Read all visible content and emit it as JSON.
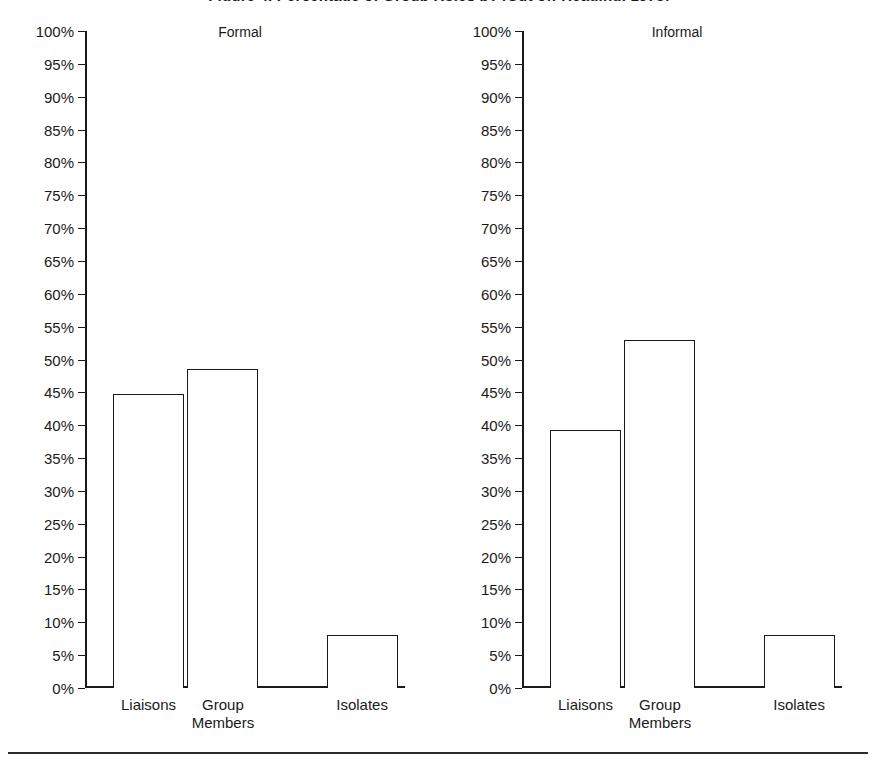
{
  "figure": {
    "title": "Figure 4. Percentage of Group Roles by (Cut off Heading, 1978)",
    "bottom_rule": true
  },
  "axis": {
    "tick_labels": [
      "100%",
      "95%",
      "90%",
      "85%",
      "80%",
      "75%",
      "70%",
      "65%",
      "60%",
      "55%",
      "50%",
      "45%",
      "40%",
      "35%",
      "30%",
      "25%",
      "20%",
      "15%",
      "10%",
      "5%",
      "0%"
    ],
    "tick_values": [
      100,
      95,
      90,
      85,
      80,
      75,
      70,
      65,
      60,
      55,
      50,
      45,
      40,
      35,
      30,
      25,
      20,
      15,
      10,
      5,
      0
    ],
    "min": 0,
    "max": 100,
    "step": 5
  },
  "panels": [
    {
      "key": "formal",
      "title": "Formal",
      "categories": [
        "Liaisons",
        "Group\nMembers",
        "Isolates"
      ],
      "values": [
        44.8,
        48.5,
        8.0
      ]
    },
    {
      "key": "informal",
      "title": "Informal",
      "categories": [
        "Liaisons",
        "Group\nMembers",
        "Isolates"
      ],
      "values": [
        39.3,
        53.0,
        8.0
      ]
    }
  ],
  "chart_data": {
    "type": "bar",
    "title": "Figure 4. Percentage of Group Roles by (Cut off Heading, 1978)",
    "xlabel": "",
    "ylabel": "",
    "ylim": [
      0,
      100
    ],
    "ytick_step": 5,
    "grid": false,
    "legend": "none",
    "bar_style": "hollow outline, black stroke, white fill",
    "categories": [
      "Liaisons",
      "Group Members",
      "Isolates"
    ],
    "panels": [
      {
        "name": "Formal",
        "categories": [
          "Liaisons",
          "Group Members",
          "Isolates"
        ],
        "values": [
          44.8,
          48.5,
          8.0
        ],
        "units": "percent"
      },
      {
        "name": "Informal",
        "categories": [
          "Liaisons",
          "Group Members",
          "Isolates"
        ],
        "values": [
          39.3,
          53.0,
          8.0
        ],
        "units": "percent"
      }
    ],
    "ytick_labels": [
      "0%",
      "5%",
      "10%",
      "15%",
      "20%",
      "25%",
      "30%",
      "35%",
      "40%",
      "45%",
      "50%",
      "55%",
      "60%",
      "65%",
      "70%",
      "75%",
      "80%",
      "85%",
      "90%",
      "95%",
      "100%"
    ]
  },
  "colors": {
    "ink": "#1a1a1a",
    "background": "#ffffff",
    "rule": "#2b2b2b"
  }
}
